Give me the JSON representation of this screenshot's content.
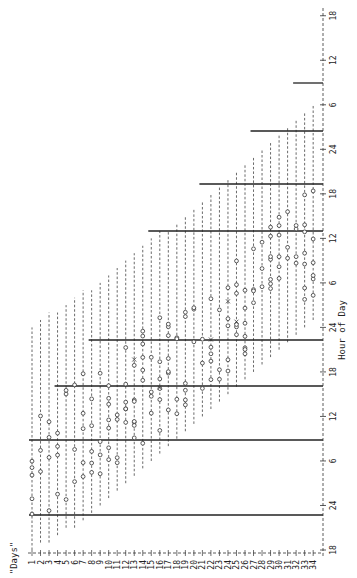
{
  "chart_data": {
    "type": "actogram",
    "orientation": "rotated 90deg counter-clockwise (days along bottom, hours along right)",
    "title": "",
    "xlabel": "\"Days\"",
    "ylabel": "Hour of Day",
    "days": [
      1,
      2,
      3,
      4,
      5,
      6,
      7,
      8,
      9,
      10,
      11,
      12,
      13,
      14,
      15,
      16,
      17,
      18,
      19,
      20,
      21,
      22,
      23,
      24,
      25,
      26,
      27,
      28,
      29,
      30,
      31,
      32,
      33,
      34
    ],
    "hour_ticks": [
      "18",
      "24",
      "6",
      "12",
      "18",
      "24",
      "6",
      "12",
      "18",
      "24",
      "6",
      "12",
      "18"
    ],
    "hour_range": [
      18,
      90
    ],
    "reference_lines": [
      {
        "hour": 22,
        "from_day": 1,
        "label": "22:00"
      },
      {
        "hour": 30,
        "from_day": 1,
        "label": "06:00"
      },
      {
        "hour": 46,
        "from_day": 4,
        "label": "22:00"
      },
      {
        "hour": 54,
        "from_day": 8,
        "label": "06:00"
      },
      {
        "hour": 70,
        "from_day": 15,
        "label": "22:00"
      },
      {
        "hour": 78,
        "from_day": 21,
        "label": "06:00"
      },
      {
        "hour": 70,
        "from_day": 27,
        "label": "22:00",
        "note": "third-day wrap"
      },
      {
        "hour": 78,
        "from_day": 32,
        "label": "06:00",
        "note": "third-day wrap"
      }
    ],
    "series": [
      {
        "name": "awake span (dashed)",
        "marker": "dash",
        "spans": [
          [
            1,
            18,
            48
          ],
          [
            2,
            19,
            49
          ],
          [
            3,
            19,
            50
          ],
          [
            4,
            20,
            50
          ],
          [
            5,
            21,
            51
          ],
          [
            6,
            21,
            52
          ],
          [
            7,
            22,
            53
          ],
          [
            8,
            23,
            53
          ],
          [
            9,
            24,
            54
          ],
          [
            10,
            25,
            55
          ],
          [
            11,
            26,
            56
          ],
          [
            12,
            27,
            57
          ],
          [
            13,
            28,
            58
          ],
          [
            14,
            29,
            59
          ],
          [
            15,
            30,
            60
          ],
          [
            16,
            31,
            61
          ],
          [
            17,
            32,
            61
          ],
          [
            18,
            33,
            62
          ],
          [
            19,
            34,
            63
          ],
          [
            20,
            35,
            64
          ],
          [
            21,
            36,
            65
          ],
          [
            22,
            37,
            66
          ],
          [
            23,
            38,
            67
          ],
          [
            24,
            39,
            68
          ],
          [
            25,
            40,
            69
          ],
          [
            26,
            41,
            70
          ],
          [
            27,
            42,
            71
          ],
          [
            28,
            43,
            72
          ],
          [
            29,
            44,
            73
          ],
          [
            30,
            45,
            74
          ],
          [
            31,
            46,
            75
          ],
          [
            32,
            47,
            76
          ],
          [
            33,
            48,
            77
          ],
          [
            34,
            49,
            78
          ]
        ]
      },
      {
        "name": "event",
        "marker": "o"
      },
      {
        "name": "special event",
        "marker": "x"
      }
    ]
  }
}
